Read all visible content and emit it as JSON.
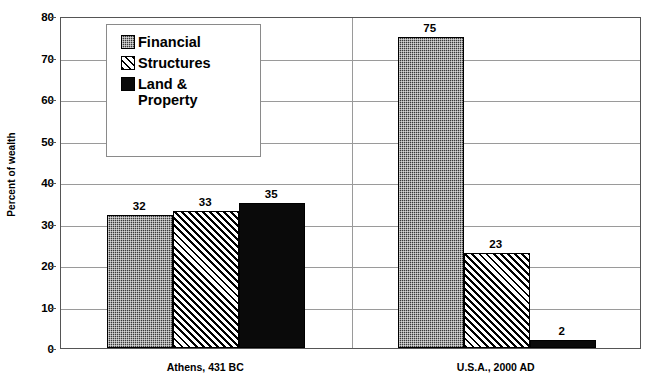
{
  "chart_data": {
    "type": "bar",
    "title": "",
    "xlabel": "",
    "ylabel": "Percent of wealth",
    "ylim": [
      0,
      80
    ],
    "yticks": [
      0,
      10,
      20,
      30,
      40,
      50,
      60,
      70,
      80
    ],
    "ytick_labels": [
      "0",
      "10",
      "20",
      "30",
      "40",
      "50",
      "60",
      "70",
      "80"
    ],
    "grid": true,
    "legend_position": "upper-left-inside",
    "categories": [
      "Athens, 431 BC",
      "U.S.A., 2000 AD"
    ],
    "series": [
      {
        "name": "Financial",
        "values": [
          32,
          75
        ],
        "pattern": "dotted-dark",
        "color": "#3a3a3a"
      },
      {
        "name": "Structures",
        "values": [
          33,
          23
        ],
        "pattern": "diagonal-hatch",
        "color": "#ffffff"
      },
      {
        "name": "Land &\nProperty",
        "values": [
          35,
          2
        ],
        "pattern": "solid-black",
        "color": "#0a0a0a"
      }
    ],
    "data_labels": [
      [
        "32",
        "33",
        "35"
      ],
      [
        "75",
        "23",
        "2"
      ]
    ]
  },
  "legend": {
    "items": [
      {
        "label": "Financial"
      },
      {
        "label": "Structures"
      },
      {
        "label": "Land &\nProperty"
      }
    ]
  },
  "axis": {
    "y_title": "Percent of wealth"
  }
}
